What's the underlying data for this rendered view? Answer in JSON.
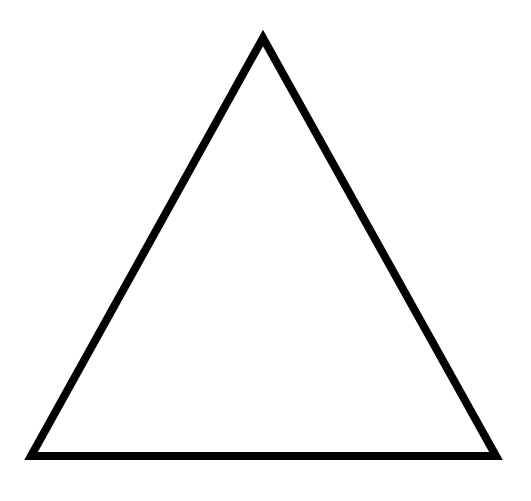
{
  "diagram": {
    "shape": "triangle",
    "type": "equilateral-outline",
    "stroke_color": "#000000",
    "fill_color": "#ffffff",
    "background_color": "#ffffff",
    "stroke_width": 8,
    "vertices": [
      {
        "name": "apex",
        "x": 263,
        "y": 38
      },
      {
        "name": "bottom-left",
        "x": 31,
        "y": 456
      },
      {
        "name": "bottom-right",
        "x": 496,
        "y": 456
      }
    ]
  }
}
